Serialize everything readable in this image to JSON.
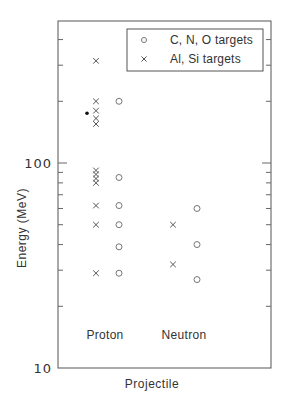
{
  "chart_data": {
    "type": "scatter",
    "title": "",
    "xlabel": "Projectile",
    "ylabel": "Energy (MeV)",
    "yscale": "log",
    "ylim": [
      10,
      480
    ],
    "ytick_labels": [
      "10",
      "100"
    ],
    "ytick_major": [
      10,
      100
    ],
    "ytick_minor": [
      20,
      30,
      40,
      50,
      60,
      70,
      80,
      90,
      200,
      300,
      400
    ],
    "categories": [
      "Proton",
      "Neutron"
    ],
    "grid": false,
    "legend_position": "upper right",
    "legend": [
      {
        "marker": "circle",
        "label": "C, N, O targets"
      },
      {
        "marker": "cross",
        "label": "Al, Si targets"
      }
    ],
    "series": [
      {
        "name": "C, N, O targets",
        "marker": "circle",
        "points": [
          {
            "category": "Proton",
            "value": 200
          },
          {
            "category": "Proton",
            "value": 85
          },
          {
            "category": "Proton",
            "value": 62
          },
          {
            "category": "Proton",
            "value": 50
          },
          {
            "category": "Proton",
            "value": 39
          },
          {
            "category": "Proton",
            "value": 29
          },
          {
            "category": "Neutron",
            "value": 60
          },
          {
            "category": "Neutron",
            "value": 40
          },
          {
            "category": "Neutron",
            "value": 27
          }
        ]
      },
      {
        "name": "Al, Si targets",
        "marker": "cross",
        "points": [
          {
            "category": "Proton",
            "value": 315
          },
          {
            "category": "Proton",
            "value": 200
          },
          {
            "category": "Proton",
            "value": 180
          },
          {
            "category": "Proton",
            "value": 165
          },
          {
            "category": "Proton",
            "value": 155
          },
          {
            "category": "Proton",
            "value": 92
          },
          {
            "category": "Proton",
            "value": 88
          },
          {
            "category": "Proton",
            "value": 84
          },
          {
            "category": "Proton",
            "value": 80
          },
          {
            "category": "Proton",
            "value": 62
          },
          {
            "category": "Proton",
            "value": 50
          },
          {
            "category": "Proton",
            "value": 29
          },
          {
            "category": "Neutron",
            "value": 50
          },
          {
            "category": "Neutron",
            "value": 32
          }
        ]
      },
      {
        "name": "unlabeled marker",
        "marker": "dot",
        "points": [
          {
            "category": "Proton",
            "value": 175
          }
        ]
      }
    ]
  },
  "layout": {
    "plot": {
      "left": 58,
      "right": 271,
      "top": 21,
      "bottom": 368
    },
    "decade_px": 205,
    "category_x": {
      "Proton": {
        "cross": 96,
        "circle": 119,
        "dot": 87,
        "label": 105
      },
      "Neutron": {
        "cross": 173,
        "circle": 197,
        "label": 184
      }
    },
    "legend_box": {
      "x": 127,
      "y": 29,
      "w": 136,
      "h": 42
    }
  }
}
